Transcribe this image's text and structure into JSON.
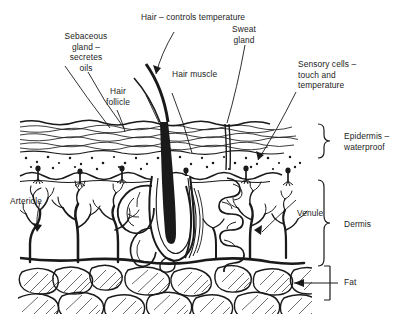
{
  "diagram": {
    "background_color": "#ffffff",
    "ink_color": "#1a1a1a",
    "labels": {
      "hair": "Hair – controls temperature",
      "sebaceous_gland": "Sebaceous\ngland –\nsecretes\noils",
      "hair_follicle": "Hair\nfollicle",
      "hair_muscle": "Hair muscle",
      "sweat_gland": "Sweat\ngland",
      "sensory_cells": "Sensory cells –\ntouch and\ntemperature",
      "epidermis": "Epidermis –\nwaterproof",
      "dermis": "Dermis",
      "fat": "Fat",
      "arteriole": "Arteriole",
      "venule": "Venule"
    },
    "layers": [
      {
        "name": "Epidermis – waterproof",
        "order": 1
      },
      {
        "name": "Dermis",
        "order": 2
      },
      {
        "name": "Fat",
        "order": 3
      }
    ],
    "structures": [
      "hair shaft",
      "hair follicle",
      "sebaceous gland",
      "hair erector muscle",
      "sweat gland",
      "sensory nerve endings",
      "arteriole",
      "venule",
      "adipose cells"
    ]
  }
}
